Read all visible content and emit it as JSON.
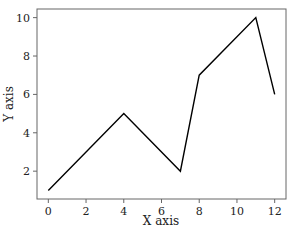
{
  "chart_data": {
    "type": "line",
    "title": "",
    "xlabel": "X axis",
    "ylabel": "Y axis",
    "x": [
      0,
      4,
      7,
      8,
      11,
      12
    ],
    "series": [
      {
        "name": "series-1",
        "values": [
          1,
          5,
          2,
          7,
          10,
          6
        ],
        "color": "#000000"
      }
    ],
    "x_ticks": [
      0,
      2,
      4,
      6,
      8,
      10,
      12
    ],
    "y_ticks": [
      2,
      4,
      6,
      8,
      10
    ],
    "xlim": [
      -0.6,
      12.6
    ],
    "ylim": [
      0.55,
      10.45
    ],
    "grid": false,
    "legend": false
  }
}
